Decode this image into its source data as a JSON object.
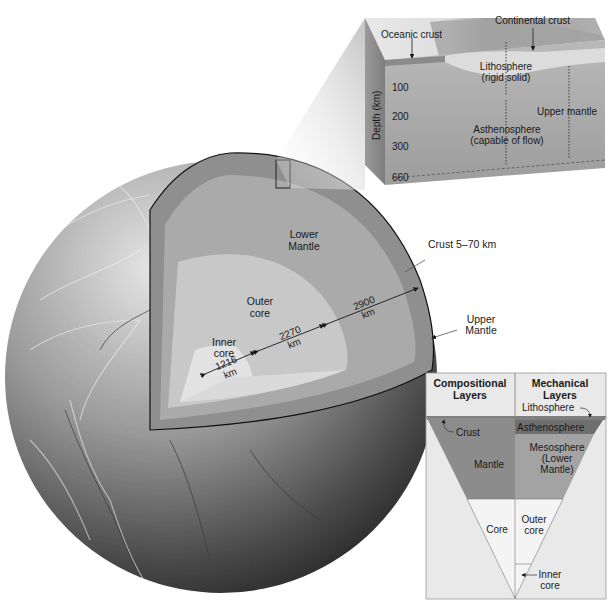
{
  "figure": {
    "colors": {
      "background": "#ffffff",
      "globe_light": "#d9d9d9",
      "globe_dark": "#2e2e2e",
      "upper_mantle_band": "#8f8f8f",
      "lower_mantle": "#a9a9a9",
      "outer_core": "#c9c9c9",
      "inner_core": "#e4e4e4",
      "legend_bg": "#e9e9e9",
      "legend_mantle": "#8c8c8c",
      "legend_asthenosphere": "#6f6f6f",
      "legend_mesosphere": "#a3a3a3",
      "legend_core": "#f4f4f4"
    }
  },
  "cross_section": {
    "labels": {
      "lower_mantle": [
        "Lower",
        "Mantle"
      ],
      "outer_core": [
        "Outer",
        "core"
      ],
      "inner_core": [
        "Inner",
        "core"
      ],
      "crust": "Crust 5–70 km",
      "upper_mantle": [
        "Upper",
        "Mantle"
      ]
    },
    "dimensions": [
      {
        "value": "1216",
        "unit": "km",
        "layer": "inner core radius"
      },
      {
        "value": "2270",
        "unit": "km",
        "layer": "outer core thickness"
      },
      {
        "value": "2900",
        "unit": "km",
        "layer": "mantle thickness"
      }
    ]
  },
  "block_diagram": {
    "labels": {
      "oceanic_crust": "Oceanic crust",
      "continental_crust": "Continental crust",
      "lithosphere": [
        "Lithosphere",
        "(rigid solid)"
      ],
      "asthenosphere": [
        "Asthenosphere",
        "(capable of flow)"
      ],
      "upper_mantle": "Upper mantle"
    },
    "depth_axis": {
      "label": "Depth (km)",
      "ticks": [
        "100",
        "200",
        "300",
        "660"
      ]
    }
  },
  "legend": {
    "headers": {
      "compositional": [
        "Compositional",
        "Layers"
      ],
      "mechanical": [
        "Mechanical",
        "Layers"
      ]
    },
    "compositional_layers": {
      "crust": "Crust",
      "mantle": "Mantle",
      "core": "Core"
    },
    "mechanical_layers": {
      "lithosphere": "Lithosphere",
      "asthenosphere": "Asthenosphere",
      "mesosphere": [
        "Mesosphere",
        "(Lower",
        "Mantle)"
      ],
      "outer_core": [
        "Outer",
        "core"
      ],
      "inner_core": [
        "Inner",
        "core"
      ]
    }
  }
}
